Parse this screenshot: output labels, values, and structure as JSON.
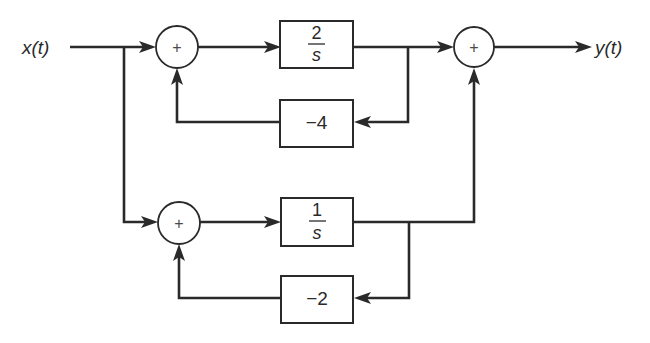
{
  "diagram": {
    "type": "block-diagram",
    "input_signal": "x(t)",
    "output_signal": "y(t)",
    "summing_junctions": [
      {
        "id": "sum1",
        "symbol": "+"
      },
      {
        "id": "sum2",
        "symbol": "+"
      },
      {
        "id": "sum3",
        "symbol": "+"
      }
    ],
    "blocks": [
      {
        "id": "upper-forward",
        "numerator": "2",
        "denominator": "s"
      },
      {
        "id": "upper-feedback",
        "gain": "−4"
      },
      {
        "id": "lower-forward",
        "numerator": "1",
        "denominator": "s"
      },
      {
        "id": "lower-feedback",
        "gain": "−2"
      }
    ],
    "connections": [
      {
        "from": "x(t)",
        "to": "sum1"
      },
      {
        "from": "x(t)",
        "to": "sum3"
      },
      {
        "from": "sum1",
        "to": "upper-forward"
      },
      {
        "from": "upper-forward",
        "to": "sum2"
      },
      {
        "from": "upper-forward",
        "to": "upper-feedback"
      },
      {
        "from": "upper-feedback",
        "to": "sum1"
      },
      {
        "from": "sum3",
        "to": "lower-forward"
      },
      {
        "from": "lower-forward",
        "to": "sum2"
      },
      {
        "from": "lower-forward",
        "to": "lower-feedback"
      },
      {
        "from": "lower-feedback",
        "to": "sum3"
      },
      {
        "from": "sum2",
        "to": "y(t)"
      }
    ]
  }
}
